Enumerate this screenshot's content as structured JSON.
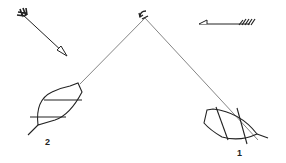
{
  "diagram": {
    "type": "sailing-layline-diagram",
    "colors": {
      "ink": "#222222",
      "line": "#555555",
      "background": "#ffffff"
    },
    "wind_arrow": {
      "direction": "from top-left toward bottom-right"
    },
    "current_arrow": {
      "direction": "from right toward left"
    },
    "mark": {
      "name": "windward mark"
    },
    "boats": [
      {
        "id": "boat-2",
        "label": "2"
      },
      {
        "id": "boat-1",
        "label": "1"
      }
    ]
  }
}
